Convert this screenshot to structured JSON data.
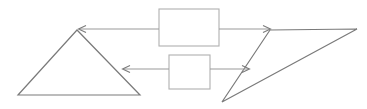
{
  "diagram": {
    "background_color": "#ffffff",
    "stroke_color": "#7a7a7a",
    "box_stroke_color": "#b0b0b0",
    "connector_color": "#9a9a9a",
    "width": 367,
    "height": 109,
    "shapes": [
      {
        "name": "left-triangle",
        "type": "triangle",
        "label": "",
        "points": "77,30 18,95 140,95"
      },
      {
        "name": "right-triangle",
        "type": "triangle",
        "label": "",
        "points": "270,30 357,29 222,102"
      },
      {
        "name": "upper-box",
        "type": "rectangle",
        "label": "",
        "x": 159,
        "y": 9,
        "width": 60,
        "height": 37
      },
      {
        "name": "lower-box",
        "type": "rectangle",
        "label": "",
        "x": 169,
        "y": 55,
        "width": 41,
        "height": 34
      }
    ],
    "connectors": [
      {
        "name": "upper-left-arrow",
        "label": "",
        "from": "upper-box",
        "to": "left-triangle-apex",
        "direction": "left",
        "x1": 159,
        "x2": 79,
        "y": 29
      },
      {
        "name": "upper-right-arrow",
        "label": "",
        "from": "upper-box",
        "to": "right-triangle-top-left",
        "direction": "right",
        "x1": 219,
        "x2": 270,
        "y": 29
      },
      {
        "name": "lower-left-arrow",
        "label": "",
        "from": "lower-box",
        "to": "left-triangle-right-edge",
        "direction": "left",
        "x1": 169,
        "x2": 123,
        "y": 69
      },
      {
        "name": "lower-right-arrow",
        "label": "",
        "from": "lower-box",
        "to": "right-triangle-left-edge",
        "direction": "right",
        "x1": 210,
        "x2": 249,
        "y": 69
      }
    ]
  }
}
